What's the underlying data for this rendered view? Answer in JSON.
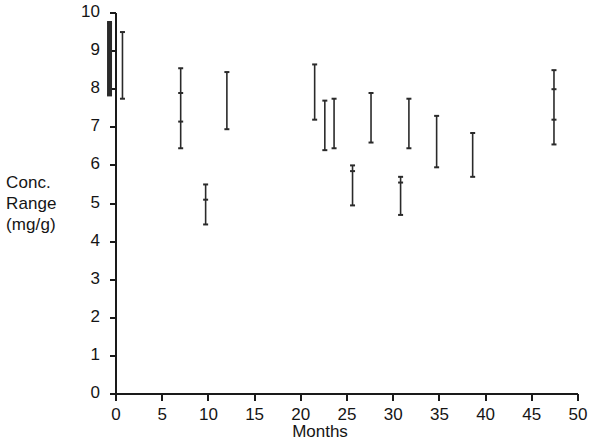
{
  "chart_data": {
    "type": "range_bar",
    "title": "",
    "xlabel": "Months",
    "ylabel_lines": [
      "Conc.",
      "Range",
      "(mg/g)"
    ],
    "ylabel": "Conc. Range (mg/g)",
    "xlim": [
      0,
      50
    ],
    "ylim": [
      0,
      10
    ],
    "xticks": [
      0,
      5,
      10,
      15,
      20,
      25,
      30,
      35,
      40,
      45,
      50
    ],
    "xtick_labels": [
      "0",
      "5",
      "10",
      "15",
      "20",
      "25",
      "30",
      "35",
      "40",
      "45",
      "50"
    ],
    "yticks": [
      0,
      1,
      2,
      3,
      4,
      5,
      6,
      7,
      8,
      9,
      10
    ],
    "ytick_labels": [
      "0",
      "1",
      "2",
      "3",
      "4",
      "5",
      "6",
      "7",
      "8",
      "9",
      "10"
    ],
    "grid": false,
    "legend": null,
    "axis_color": "#1a1a1a",
    "series_color": "#2a2a2a",
    "bars": [
      {
        "x": -0.7,
        "low": 7.85,
        "high": 9.75,
        "emphasis": "bold",
        "marks": []
      },
      {
        "x": 0.7,
        "low": 7.75,
        "high": 9.5,
        "emphasis": "normal",
        "marks": []
      },
      {
        "x": 7.0,
        "low": 6.45,
        "high": 8.55,
        "emphasis": "normal",
        "marks": [
          7.9,
          7.15
        ]
      },
      {
        "x": 9.7,
        "low": 4.45,
        "high": 5.5,
        "emphasis": "normal",
        "marks": [
          5.1
        ]
      },
      {
        "x": 12.0,
        "low": 6.95,
        "high": 8.45,
        "emphasis": "normal",
        "marks": []
      },
      {
        "x": 21.5,
        "low": 7.2,
        "high": 8.65,
        "emphasis": "normal",
        "marks": []
      },
      {
        "x": 22.6,
        "low": 6.4,
        "high": 7.7,
        "emphasis": "normal",
        "marks": []
      },
      {
        "x": 23.6,
        "low": 6.45,
        "high": 7.75,
        "emphasis": "normal",
        "marks": []
      },
      {
        "x": 25.6,
        "low": 4.95,
        "high": 6.0,
        "emphasis": "normal",
        "marks": [
          5.85
        ]
      },
      {
        "x": 27.6,
        "low": 6.6,
        "high": 7.9,
        "emphasis": "normal",
        "marks": []
      },
      {
        "x": 30.8,
        "low": 4.7,
        "high": 5.7,
        "emphasis": "normal",
        "marks": [
          5.55
        ]
      },
      {
        "x": 31.7,
        "low": 6.45,
        "high": 7.75,
        "emphasis": "normal",
        "marks": []
      },
      {
        "x": 34.7,
        "low": 5.95,
        "high": 7.3,
        "emphasis": "normal",
        "marks": []
      },
      {
        "x": 38.6,
        "low": 5.7,
        "high": 6.85,
        "emphasis": "normal",
        "marks": []
      },
      {
        "x": 47.4,
        "low": 6.55,
        "high": 8.5,
        "emphasis": "normal",
        "marks": [
          8.0,
          7.2
        ]
      }
    ]
  }
}
